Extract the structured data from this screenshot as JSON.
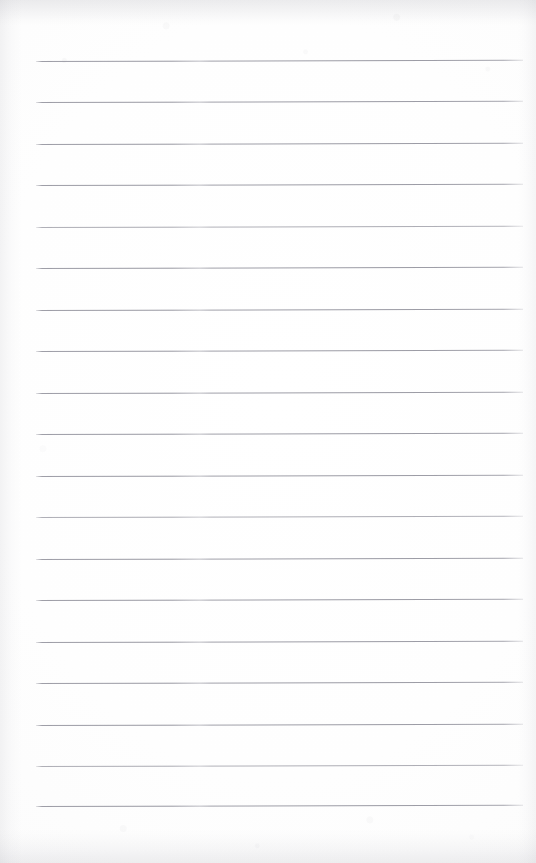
{
  "document": {
    "type": "scanned-page",
    "title": "Lined notebook page",
    "description": "Blank ruled notebook sheet, no handwriting or printed text",
    "has_text_content": false,
    "page_width": 536,
    "page_height": 863,
    "paper_color": "#fdfdfd",
    "rule_color": "#96969c",
    "edge_shadow_color": "#aeaeb6"
  },
  "ruling": {
    "style": "horizontal ruled lines",
    "line_count": 19,
    "line_thickness_px": 1,
    "line_spacing_px": 41.4,
    "left_margin_px": 36,
    "right_margin_px": 523,
    "first_line_y_px": 61,
    "last_line_y_px": 806,
    "tilt_degrees": -0.16,
    "lines": [
      {
        "index": 1,
        "y": 61,
        "x1": 36,
        "x2": 523,
        "faint": false
      },
      {
        "index": 2,
        "y": 102,
        "x1": 36,
        "x2": 523,
        "faint": false
      },
      {
        "index": 3,
        "y": 144,
        "x1": 36,
        "x2": 523,
        "faint": false
      },
      {
        "index": 4,
        "y": 185,
        "x1": 36,
        "x2": 523,
        "faint": false
      },
      {
        "index": 5,
        "y": 227,
        "x1": 36,
        "x2": 523,
        "faint": true
      },
      {
        "index": 6,
        "y": 268,
        "x1": 36,
        "x2": 523,
        "faint": false
      },
      {
        "index": 7,
        "y": 310,
        "x1": 36,
        "x2": 523,
        "faint": false
      },
      {
        "index": 8,
        "y": 351,
        "x1": 36,
        "x2": 523,
        "faint": false
      },
      {
        "index": 9,
        "y": 393,
        "x1": 36,
        "x2": 523,
        "faint": false
      },
      {
        "index": 10,
        "y": 434,
        "x1": 36,
        "x2": 523,
        "faint": false
      },
      {
        "index": 11,
        "y": 476,
        "x1": 36,
        "x2": 523,
        "faint": false
      },
      {
        "index": 12,
        "y": 517,
        "x1": 36,
        "x2": 523,
        "faint": true
      },
      {
        "index": 13,
        "y": 559,
        "x1": 36,
        "x2": 523,
        "faint": false
      },
      {
        "index": 14,
        "y": 600,
        "x1": 36,
        "x2": 523,
        "faint": false
      },
      {
        "index": 15,
        "y": 642,
        "x1": 36,
        "x2": 523,
        "faint": false
      },
      {
        "index": 16,
        "y": 683,
        "x1": 36,
        "x2": 523,
        "faint": false
      },
      {
        "index": 17,
        "y": 725,
        "x1": 36,
        "x2": 523,
        "faint": false
      },
      {
        "index": 18,
        "y": 766,
        "x1": 36,
        "x2": 523,
        "faint": true
      },
      {
        "index": 19,
        "y": 806,
        "x1": 36,
        "x2": 523,
        "faint": false
      }
    ]
  },
  "regions": {
    "top_margin_label": "",
    "bottom_margin_label": "",
    "writing_area_label": ""
  }
}
